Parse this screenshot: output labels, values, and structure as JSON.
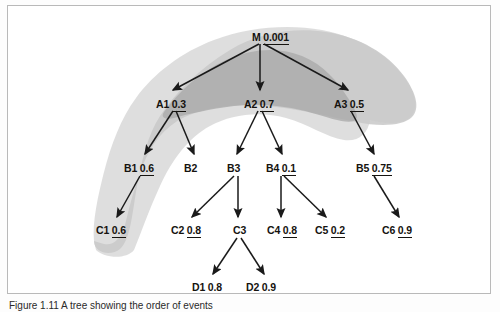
{
  "figure": {
    "caption": "Figure 1.11  A tree showing the order of events",
    "background_color": "#ffffff",
    "border_color": "#b9b9b9"
  },
  "diagram": {
    "type": "tree",
    "blob_outer_color": "#c9c9c9",
    "blob_inner_color": "#b3b3b3",
    "arrow_color": "#1a1a1a",
    "nodes": [
      {
        "id": "M",
        "label": "M",
        "value": "0.001",
        "x": 255,
        "y": 33
      },
      {
        "id": "A1",
        "label": "A1",
        "value": "0.3",
        "x": 160,
        "y": 100
      },
      {
        "id": "A2",
        "label": "A2",
        "value": "0.7",
        "x": 247,
        "y": 100
      },
      {
        "id": "A3",
        "label": "A3",
        "value": "0.5",
        "x": 338,
        "y": 100
      },
      {
        "id": "B1",
        "label": "B1",
        "value": "0.6",
        "x": 128,
        "y": 164
      },
      {
        "id": "B2",
        "label": "B2",
        "value": "",
        "x": 180,
        "y": 164
      },
      {
        "id": "B3",
        "label": "B3",
        "value": "",
        "x": 222,
        "y": 164
      },
      {
        "id": "B4",
        "label": "B4",
        "value": "0.1",
        "x": 270,
        "y": 164
      },
      {
        "id": "B5",
        "label": "B5",
        "value": "0.75",
        "x": 360,
        "y": 164
      },
      {
        "id": "C1",
        "label": "C1",
        "value": "0.6",
        "x": 100,
        "y": 226
      },
      {
        "id": "C2",
        "label": "C2",
        "value": "0.8",
        "x": 175,
        "y": 226
      },
      {
        "id": "C3",
        "label": "C3",
        "value": "",
        "x": 227,
        "y": 226
      },
      {
        "id": "C4",
        "label": "C4",
        "value": "0.8",
        "x": 270,
        "y": 226
      },
      {
        "id": "C5",
        "label": "C5",
        "value": "0.2",
        "x": 318,
        "y": 226
      },
      {
        "id": "C6",
        "label": "C6",
        "value": "0.9",
        "x": 385,
        "y": 226
      },
      {
        "id": "D1",
        "label": "D1",
        "value": "0.8",
        "x": 196,
        "y": 283
      },
      {
        "id": "D2",
        "label": "D2",
        "value": "0.9",
        "x": 250,
        "y": 283
      }
    ],
    "edges": [
      {
        "from": "M",
        "to": "A1"
      },
      {
        "from": "M",
        "to": "A2"
      },
      {
        "from": "M",
        "to": "A3"
      },
      {
        "from": "A1",
        "to": "B1"
      },
      {
        "from": "A1",
        "to": "B2"
      },
      {
        "from": "A2",
        "to": "B3"
      },
      {
        "from": "A2",
        "to": "B4"
      },
      {
        "from": "A3",
        "to": "B5"
      },
      {
        "from": "B1",
        "to": "C1"
      },
      {
        "from": "B3",
        "to": "C2"
      },
      {
        "from": "B3",
        "to": "C3"
      },
      {
        "from": "B4",
        "to": "C4"
      },
      {
        "from": "B4",
        "to": "C5"
      },
      {
        "from": "B5",
        "to": "C6"
      },
      {
        "from": "C3",
        "to": "D1"
      },
      {
        "from": "C3",
        "to": "D2"
      }
    ]
  }
}
